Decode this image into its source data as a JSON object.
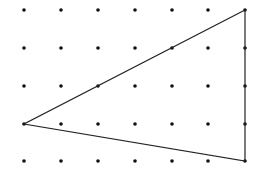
{
  "diagram": {
    "type": "dot-grid-triangle",
    "grid": {
      "columns": 7,
      "rows": 5,
      "x_positions": [
        24,
        61,
        98,
        135,
        172,
        208,
        245
      ],
      "y_positions": [
        10,
        48,
        86,
        124,
        161
      ],
      "dot_radius": 1.8,
      "dot_color": "#111111"
    },
    "triangle": {
      "vertices": [
        {
          "col": 6,
          "row": 0
        },
        {
          "col": 0,
          "row": 3
        },
        {
          "col": 6,
          "row": 4
        }
      ],
      "stroke_color": "#222222",
      "stroke_width": 1.2
    }
  }
}
